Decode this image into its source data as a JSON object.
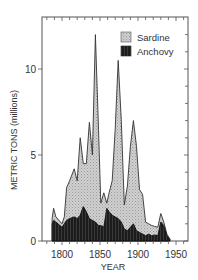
{
  "chart_data": {
    "type": "area",
    "title": "",
    "xlabel": "YEAR",
    "ylabel": "METRIC TONS (millions)",
    "xlim": [
      1774,
      1966
    ],
    "ylim": [
      0,
      12.9
    ],
    "x_ticks": [
      1800,
      1850,
      1900,
      1950
    ],
    "y_ticks": [
      0,
      5,
      10
    ],
    "grid": false,
    "legend_position": "upper right",
    "stacked": true,
    "x": [
      1787,
      1789,
      1792,
      1796,
      1800,
      1805,
      1810,
      1814,
      1818,
      1823,
      1828,
      1833,
      1837,
      1841,
      1846,
      1850,
      1854,
      1858,
      1862,
      1867,
      1871,
      1875,
      1879,
      1884,
      1888,
      1891,
      1895,
      1899,
      1905,
      1908,
      1914,
      1918,
      1922,
      1927,
      1932,
      1937,
      1941,
      1946,
      1950,
      1954,
      1957,
      1960,
      1963,
      1965
    ],
    "series": [
      {
        "name": "Sardine",
        "color": "#c8c8c8",
        "pattern": "stippled light gray",
        "values": [
          1.2,
          1.9,
          1.3,
          1.1,
          0.9,
          1.3,
          3.1,
          3.6,
          4.2,
          3.6,
          6.0,
          4.5,
          4.5,
          6.9,
          5.1,
          12.0,
          6.2,
          2.3,
          2.7,
          2.3,
          3.2,
          6.5,
          10.4,
          6.5,
          2.1,
          3.0,
          6.8,
          5.8,
          3.0,
          2.8,
          1.1,
          1.0,
          0.9,
          0.8,
          1.6,
          1.1,
          0.4,
          0,
          0,
          0,
          0,
          0,
          0,
          0
        ],
        "note": "values are the Sardine layer height on top of Anchovy; see total_top for the outline"
      },
      {
        "name": "Anchovy",
        "color": "#1a1a1a",
        "pattern": "dark hatched",
        "values": [
          1.0,
          1.2,
          1.1,
          0.9,
          0.8,
          1.1,
          1.3,
          1.4,
          1.3,
          1.5,
          2.0,
          1.7,
          1.2,
          1.1,
          1.1,
          0.9,
          0.9,
          0.8,
          1.9,
          1.7,
          1.5,
          1.3,
          1.2,
          0.9,
          0.6,
          0.6,
          0.8,
          1.0,
          0.5,
          0.4,
          0.4,
          0.3,
          0.3,
          0.3,
          1.1,
          0.9,
          0.3,
          0,
          0,
          0,
          0,
          0,
          0,
          0
        ]
      }
    ],
    "total_top": {
      "x": [
        1787,
        1789,
        1792,
        1800,
        1803,
        1806,
        1810,
        1816,
        1820,
        1824,
        1828,
        1832,
        1836,
        1840,
        1844,
        1848,
        1851,
        1855,
        1859,
        1862,
        1866,
        1870,
        1874,
        1878,
        1882,
        1886,
        1890,
        1894,
        1898,
        1902,
        1906,
        1910,
        1914,
        1918,
        1922,
        1926,
        1930,
        1934,
        1938,
        1942,
        1946,
        1950,
        1954,
        1958,
        1961,
        1964,
        1966
      ],
      "sardine_top": [
        1.3,
        1.9,
        1.4,
        1.0,
        1.4,
        3.1,
        3.5,
        4.2,
        3.5,
        6.0,
        4.5,
        4.5,
        6.9,
        5.0,
        12.0,
        6.5,
        2.2,
        2.8,
        2.2,
        2.8,
        3.5,
        6.5,
        10.5,
        7.0,
        2.1,
        3.2,
        5.5,
        7.0,
        5.5,
        3.0,
        2.7,
        1.1,
        1.0,
        0.9,
        0.85,
        0.8,
        1.6,
        1.1,
        0.4,
        0,
        0,
        0,
        0,
        0,
        0,
        0,
        0
      ],
      "anchovy_top": [
        1.0,
        1.2,
        1.1,
        0.8,
        1.0,
        1.2,
        1.3,
        1.4,
        1.3,
        1.5,
        2.0,
        1.7,
        1.3,
        1.2,
        1.1,
        0.9,
        0.9,
        0.8,
        1.9,
        1.7,
        1.5,
        1.4,
        1.3,
        1.1,
        0.7,
        0.6,
        0.8,
        1.0,
        0.6,
        0.5,
        0.4,
        0.3,
        0.4,
        0.3,
        0.35,
        0.3,
        1.1,
        0.9,
        0.3,
        0,
        0,
        0,
        0,
        0,
        0,
        0,
        0
      ]
    }
  },
  "legend": {
    "items": [
      {
        "label": "Sardine",
        "color": "#c8c8c8"
      },
      {
        "label": "Anchovy",
        "color": "#1a1a1a"
      }
    ]
  },
  "axes": {
    "x_title": "YEAR",
    "y_title": "METRIC TONS (millions)",
    "x_tick_labels": [
      "1800",
      "1850",
      "1900",
      "1950"
    ],
    "y_tick_labels": [
      "0",
      "5",
      "10"
    ]
  }
}
